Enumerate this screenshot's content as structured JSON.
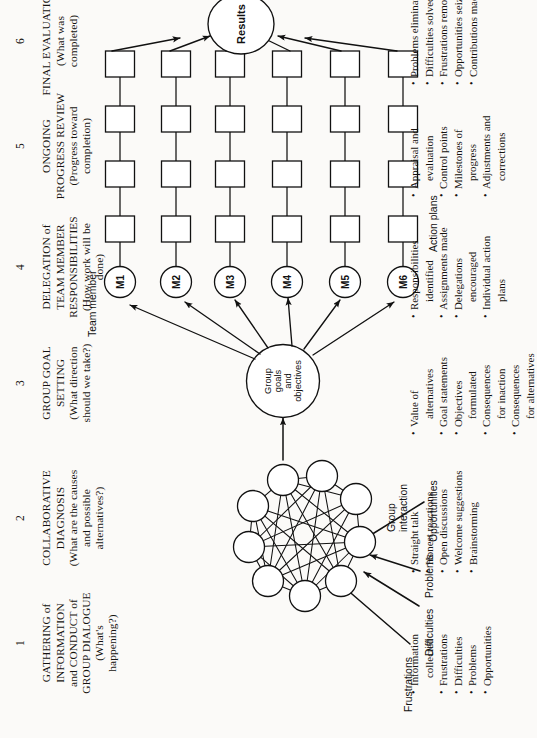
{
  "figure": {
    "columns": [
      {
        "num": "1",
        "title_lines": [
          "GATHERING of",
          "INFORMATION",
          "and CONDUCT of",
          "GROUP DIALOGUE"
        ],
        "question_lines": [
          "(What's",
          "happening?)"
        ],
        "bullets": [
          {
            "text": "Information",
            "cont": "collected"
          },
          {
            "text": "Frustrations"
          },
          {
            "text": "Difficulties"
          },
          {
            "text": "Problems"
          },
          {
            "text": "Opportunities"
          }
        ]
      },
      {
        "num": "2",
        "title_lines": [
          "COLLABORATIVE",
          "DIAGNOSIS"
        ],
        "question_lines": [
          "(What are the causes",
          "and possible",
          "alternatives?)"
        ],
        "bullets": [
          {
            "text": "Straight talk"
          },
          {
            "text": "Honest reactions"
          },
          {
            "text": "Open discussions"
          },
          {
            "text": "Welcome suggestions"
          },
          {
            "text": "Brainstorming"
          }
        ]
      },
      {
        "num": "3",
        "title_lines": [
          "GROUP GOAL",
          "SETTING"
        ],
        "question_lines": [
          "(What direction",
          "should we take?)"
        ],
        "bullets": [
          {
            "text": "Value of",
            "cont": "alternatives"
          },
          {
            "text": "Goal statements"
          },
          {
            "text": "Objectives",
            "cont": "formulated"
          },
          {
            "text": "Consequences",
            "cont": "for inaction"
          },
          {
            "text": "Consequences",
            "cont": "for alternatives"
          }
        ]
      },
      {
        "num": "4",
        "title_lines": [
          "DELEGATION of",
          "TEAM MEMBER",
          "RESPONSIBILITIES"
        ],
        "question_lines": [
          "(How work will be",
          "done)"
        ],
        "bullets": [
          {
            "text": "Responsibilities",
            "cont": "identified"
          },
          {
            "text": "Assignments made"
          },
          {
            "text": "Delegations",
            "cont": "encouraged"
          },
          {
            "text": "Individual action",
            "cont": "plans"
          }
        ]
      },
      {
        "num": "5",
        "title_lines": [
          "ONGOING",
          "PROGRESS REVIEW"
        ],
        "question_lines": [
          "(Progress toward",
          "completion)"
        ],
        "bullets": [
          {
            "text": "Appraisal and",
            "cont": "evaluation"
          },
          {
            "text": "Control points"
          },
          {
            "text": "Milestones of",
            "cont": "progress"
          },
          {
            "text": "Adjustments and",
            "cont": "corrections"
          }
        ]
      },
      {
        "num": "6",
        "title_lines": [
          "FINAL EVALUATION"
        ],
        "question_lines": [
          "(What was",
          "completed)"
        ],
        "bullets": [
          {
            "text": "Problems eliminated"
          },
          {
            "text": "Difficulties solved"
          },
          {
            "text": "Frustrations removed"
          },
          {
            "text": "Opportunities seized"
          },
          {
            "text": "Contributions made"
          }
        ]
      }
    ],
    "inputs": [
      {
        "label": "Frustrations"
      },
      {
        "label": "Difficulties"
      },
      {
        "label": "Problems"
      },
      {
        "label": "Opportunities"
      }
    ],
    "labels": {
      "group_interaction_line1": "Group",
      "group_interaction_line2": "interaction",
      "team_member": "Team member",
      "action_plans": "Action plans"
    },
    "nodes": {
      "goal_circle_lines": [
        "Group",
        "goals",
        "and",
        "objectives"
      ],
      "results": "Results",
      "members": [
        "M1",
        "M2",
        "M3",
        "M4",
        "M5",
        "M6"
      ]
    },
    "colors": {
      "ink": "#15120f",
      "stroke": "#111111",
      "paper": "#fbfaf8"
    }
  }
}
